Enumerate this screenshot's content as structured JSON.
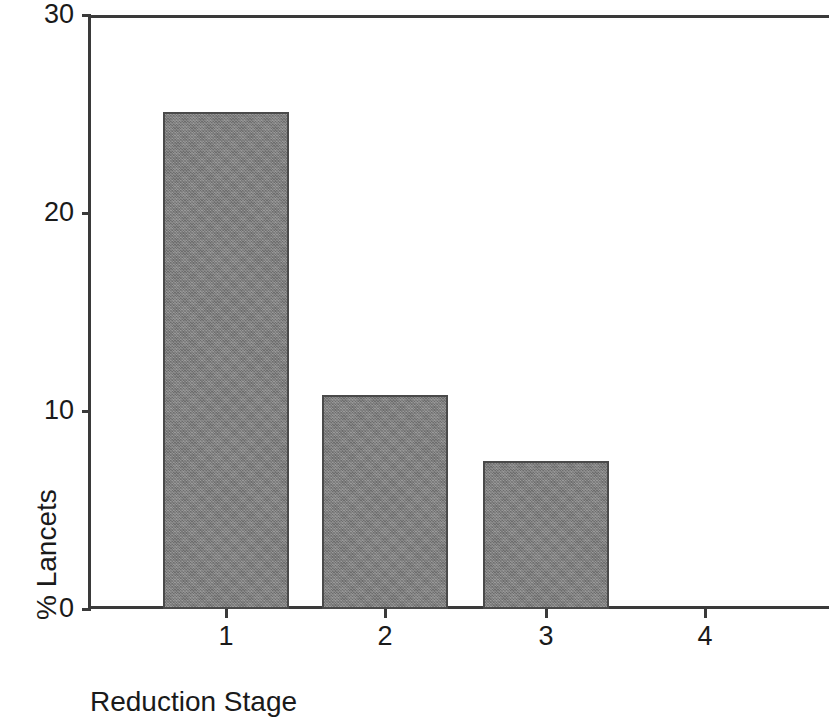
{
  "chart_data": {
    "type": "bar",
    "title": "",
    "subtitle": "",
    "xlabel": "Reduction Stage",
    "ylabel": "% Lancets",
    "categories": [
      "1",
      "2",
      "3",
      "4"
    ],
    "values": [
      25.1,
      10.8,
      7.5,
      0
    ],
    "series": [
      {
        "name": "% Lancets",
        "values": [
          25.1,
          10.8,
          7.5,
          0
        ]
      }
    ],
    "ylim": [
      0,
      30
    ],
    "yticks": [
      0,
      10,
      20,
      30
    ],
    "ytick_labels": [
      "0",
      "10",
      "20",
      "30"
    ],
    "xtick_labels": [
      "1",
      "2",
      "3",
      "4"
    ],
    "grid": false,
    "legend": false,
    "legend_position": "none",
    "bar_color": "#828282",
    "bar_edge_color": "#4a4a4a",
    "axis_color": "#3a3a3a",
    "background_color": "#ffffff",
    "annotations": []
  },
  "axes": {
    "y_title": "% Lancets",
    "x_title": "Reduction Stage"
  }
}
